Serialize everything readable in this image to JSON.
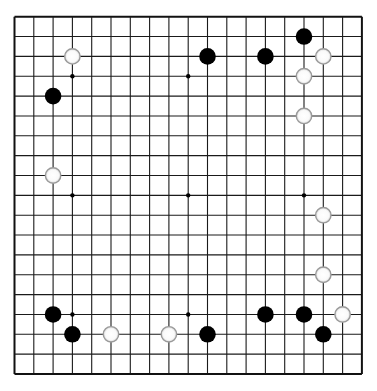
{
  "board": {
    "size": 19,
    "origin_x": 14.5,
    "origin_y": 16.7,
    "step_x": 19.3,
    "step_y": 19.85,
    "background": "#ffffff",
    "line_color": "#1a1a1a",
    "edge_color": "#111111",
    "stone_radius": 8.3,
    "star_radius": 2.2
  },
  "star_points": [
    [
      3,
      3
    ],
    [
      9,
      3
    ],
    [
      15,
      3
    ],
    [
      3,
      9
    ],
    [
      9,
      9
    ],
    [
      15,
      9
    ],
    [
      3,
      15
    ],
    [
      9,
      15
    ],
    [
      15,
      15
    ]
  ],
  "stones": {
    "black": [
      [
        2,
        4
      ],
      [
        10,
        2
      ],
      [
        13,
        2
      ],
      [
        15,
        1
      ],
      [
        2,
        15
      ],
      [
        3,
        16
      ],
      [
        10,
        16
      ],
      [
        13,
        15
      ],
      [
        15,
        15
      ],
      [
        16,
        16
      ]
    ],
    "white": [
      [
        3,
        2
      ],
      [
        16,
        2
      ],
      [
        15,
        3
      ],
      [
        15,
        5
      ],
      [
        2,
        8
      ],
      [
        16,
        10
      ],
      [
        16,
        13
      ],
      [
        5,
        16
      ],
      [
        8,
        16
      ],
      [
        17,
        15
      ]
    ]
  },
  "colors": {
    "black_stone": "#000000",
    "white_stone_fill": "#ffffff",
    "white_stone_border": "#9a9a9a"
  }
}
